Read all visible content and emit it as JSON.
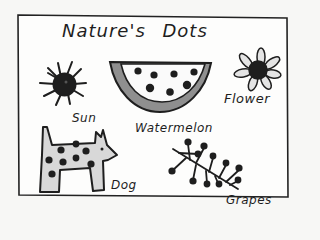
{
  "title": "Nature's Dots",
  "items": {
    "sun": {
      "label": "Sun"
    },
    "watermelon": {
      "label": "Watermelon"
    },
    "flower": {
      "label": "Flower"
    },
    "dog": {
      "label": "Dog"
    },
    "grapes": {
      "label": "Grapes"
    }
  },
  "colors": {
    "ink": "#1e1e1e",
    "paper": "#f7f7f5",
    "gray_fill": "#9a9a9a",
    "light_fill": "#d6d6d6"
  }
}
